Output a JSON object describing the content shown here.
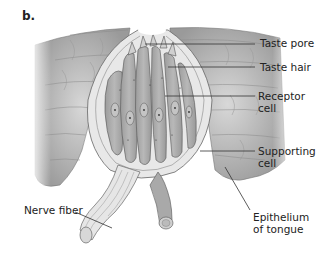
{
  "figure": {
    "panel_letter": "b.",
    "labels": {
      "taste_pore": "Taste pore",
      "taste_hair": "Taste hair",
      "receptor_cell_1": "Receptor",
      "receptor_cell_2": "cell",
      "supporting_cell_1": "Supporting",
      "supporting_cell_2": "cell",
      "nerve_fiber": "Nerve fiber",
      "epithelium_1": "Epithelium",
      "epithelium_2": "of tongue"
    },
    "colors": {
      "tissue": "#b9b9b9",
      "cell_fill": "#a8a8a8",
      "outline": "#555555",
      "text": "#222222"
    }
  }
}
